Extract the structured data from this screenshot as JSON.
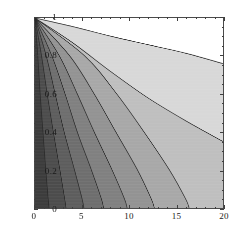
{
  "chart_data": {
    "type": "heatmap",
    "title": "",
    "subtitle": "",
    "xlabel": "",
    "ylabel": "",
    "xlim": [
      0,
      20
    ],
    "ylim": [
      0,
      1
    ],
    "grid": false,
    "legend": "none",
    "style": "grayscale contour / density plot",
    "x_ticks": [
      {
        "value": 0,
        "label": "0"
      },
      {
        "value": 5,
        "label": "5"
      },
      {
        "value": 10,
        "label": "10"
      },
      {
        "value": 15,
        "label": "15"
      },
      {
        "value": 20,
        "label": "20"
      }
    ],
    "y_ticks": [
      {
        "value": 0,
        "label": "0"
      },
      {
        "value": 0.2,
        "label": "0.2"
      },
      {
        "value": 0.4,
        "label": "0.4"
      },
      {
        "value": 0.6,
        "label": "0.6"
      },
      {
        "value": 0.8,
        "label": "0.8"
      },
      {
        "value": 1,
        "label": "1"
      }
    ],
    "x_minor_tick_step": 1,
    "y_minor_tick_step": 0.05,
    "contour_levels": 9,
    "shade_colors": [
      "#3c3c3c",
      "#4c4c4c",
      "#5d5d5d",
      "#6e6e6e",
      "#808080",
      "#939393",
      "#a8a8a8",
      "#bfbfbf",
      "#d8d8d8",
      "#ffffff"
    ],
    "contour_line_color": "#2b2b2b",
    "frame_color": "#4a4a4a",
    "background_color": "#ffffff",
    "contours": [
      {
        "level": 1,
        "x_at_y0": 1.5,
        "y_at_x20": null,
        "points": [
          [
            0,
            1
          ],
          [
            0.3,
            0.8
          ],
          [
            0.55,
            0.6
          ],
          [
            0.85,
            0.4
          ],
          [
            1.15,
            0.2
          ],
          [
            1.4,
            0.05
          ],
          [
            1.5,
            0
          ]
        ]
      },
      {
        "level": 2,
        "x_at_y0": 3.3,
        "y_at_x20": null,
        "points": [
          [
            0,
            1
          ],
          [
            0.7,
            0.8
          ],
          [
            1.3,
            0.6
          ],
          [
            1.95,
            0.4
          ],
          [
            2.65,
            0.2
          ],
          [
            3.15,
            0.05
          ],
          [
            3.3,
            0
          ]
        ]
      },
      {
        "level": 3,
        "x_at_y0": 5.2,
        "y_at_x20": null,
        "points": [
          [
            0,
            1
          ],
          [
            1.2,
            0.8
          ],
          [
            2.15,
            0.6
          ],
          [
            3.1,
            0.4
          ],
          [
            4.2,
            0.2
          ],
          [
            5.0,
            0.05
          ],
          [
            5.2,
            0
          ]
        ]
      },
      {
        "level": 4,
        "x_at_y0": 7.3,
        "y_at_x20": null,
        "points": [
          [
            0,
            1
          ],
          [
            1.8,
            0.8
          ],
          [
            3.2,
            0.6
          ],
          [
            4.5,
            0.4
          ],
          [
            6.0,
            0.2
          ],
          [
            7.05,
            0.05
          ],
          [
            7.3,
            0
          ]
        ]
      },
      {
        "level": 5,
        "x_at_y0": 9.8,
        "y_at_x20": null,
        "points": [
          [
            0,
            1
          ],
          [
            2.6,
            0.8
          ],
          [
            4.5,
            0.6
          ],
          [
            6.3,
            0.4
          ],
          [
            8.2,
            0.2
          ],
          [
            9.5,
            0.05
          ],
          [
            9.8,
            0
          ]
        ]
      },
      {
        "level": 6,
        "x_at_y0": 12.7,
        "y_at_x20": null,
        "points": [
          [
            0,
            1
          ],
          [
            3.7,
            0.8
          ],
          [
            6.3,
            0.6
          ],
          [
            8.6,
            0.4
          ],
          [
            10.9,
            0.2
          ],
          [
            12.35,
            0.05
          ],
          [
            12.7,
            0
          ]
        ]
      },
      {
        "level": 7,
        "x_at_y0": 16.4,
        "y_at_x20": null,
        "points": [
          [
            0,
            1
          ],
          [
            5.3,
            0.8
          ],
          [
            8.7,
            0.6
          ],
          [
            11.6,
            0.4
          ],
          [
            14.3,
            0.2
          ],
          [
            16.0,
            0.05
          ],
          [
            16.4,
            0
          ]
        ]
      },
      {
        "level": 8,
        "x_at_y0": null,
        "y_at_x20": 0.35,
        "points": [
          [
            0,
            1
          ],
          [
            4.0,
            0.87
          ],
          [
            8.0,
            0.72
          ],
          [
            12.0,
            0.58
          ],
          [
            16.0,
            0.46
          ],
          [
            20.0,
            0.35
          ]
        ]
      },
      {
        "level": 9,
        "x_at_y0": null,
        "y_at_x20": 0.76,
        "points": [
          [
            0,
            1
          ],
          [
            4.0,
            0.955
          ],
          [
            8.0,
            0.905
          ],
          [
            12.0,
            0.86
          ],
          [
            16.0,
            0.815
          ],
          [
            20.0,
            0.76
          ]
        ]
      }
    ]
  }
}
